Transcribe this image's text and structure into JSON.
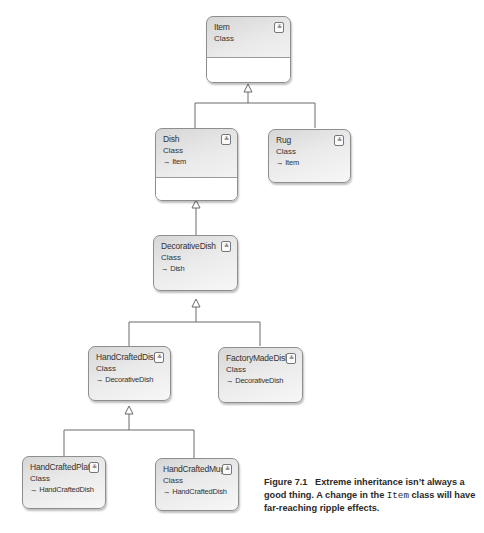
{
  "diagram": {
    "type": "UML class diagram",
    "classes": [
      {
        "id": "item",
        "name": "Item",
        "kind": "Class",
        "parent": null,
        "collapse_icon": "chevron-double-down"
      },
      {
        "id": "dish",
        "name": "Dish",
        "kind": "Class",
        "parent": "→ Item",
        "collapse_icon": "chevron-double-down"
      },
      {
        "id": "rug",
        "name": "Rug",
        "kind": "Class",
        "parent": "→ Item",
        "collapse_icon": "chevron-double-down"
      },
      {
        "id": "decorative_dish",
        "name": "DecorativeDish",
        "kind": "Class",
        "parent": "→ Dish",
        "collapse_icon": "chevron-double-down"
      },
      {
        "id": "hand_crafted_dish",
        "name": "HandCraftedDish",
        "kind": "Class",
        "parent": "→ DecorativeDish",
        "collapse_icon": "chevron-double-down"
      },
      {
        "id": "factory_made_dish",
        "name": "FactoryMadeDish",
        "kind": "Class",
        "parent": "→ DecorativeDish",
        "collapse_icon": "chevron-double-down"
      },
      {
        "id": "hand_crafted_plate",
        "name": "HandCraftedPlate",
        "kind": "Class",
        "parent": "→ HandCraftedDish",
        "collapse_icon": "chevron-double-down"
      },
      {
        "id": "hand_crafted_mug",
        "name": "HandCraftedMug",
        "kind": "Class",
        "parent": "→ HandCraftedDish",
        "collapse_icon": "chevron-double-down"
      }
    ],
    "inheritance": [
      {
        "child": "Dish",
        "parent": "Item"
      },
      {
        "child": "Rug",
        "parent": "Item"
      },
      {
        "child": "DecorativeDish",
        "parent": "Dish"
      },
      {
        "child": "HandCraftedDish",
        "parent": "DecorativeDish"
      },
      {
        "child": "FactoryMadeDish",
        "parent": "DecorativeDish"
      },
      {
        "child": "HandCraftedPlate",
        "parent": "HandCraftedDish"
      },
      {
        "child": "HandCraftedMug",
        "parent": "HandCraftedDish"
      }
    ],
    "collapse_glyph": "≚"
  },
  "caption": {
    "label": "Figure 7.1",
    "text_before": "Extreme inheritance isn’t always a good thing. A change in the",
    "code": "Item",
    "text_after": "class will have far-reaching ripple effects."
  }
}
